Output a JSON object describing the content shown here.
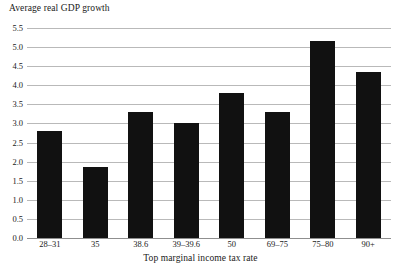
{
  "chart_data": {
    "type": "bar",
    "title": "",
    "xlabel": "Top marginal income tax rate",
    "ylabel": "Average real GDP growth",
    "categories": [
      "28–31",
      "35",
      "38.6",
      "39–39.6",
      "50",
      "69–75",
      "75–80",
      "90+"
    ],
    "values": [
      2.8,
      1.85,
      3.3,
      3.0,
      3.8,
      3.3,
      5.15,
      4.35
    ],
    "ylim": [
      0.0,
      5.5
    ],
    "ytick_labels": [
      "0.0",
      "0.5",
      "1.0",
      "1.5",
      "2.0",
      "2.5",
      "3.0",
      "3.5",
      "4.0",
      "4.5",
      "5.0",
      "5.5"
    ],
    "ytick_values": [
      0.0,
      0.5,
      1.0,
      1.5,
      2.0,
      2.5,
      3.0,
      3.5,
      4.0,
      4.5,
      5.0,
      5.5
    ],
    "grid": true,
    "legend": false,
    "bar_color": "#111111",
    "gridline_color": "#b9b9b9",
    "axis_color": "#8f8f8f",
    "text_color": "#1a1a1a"
  }
}
